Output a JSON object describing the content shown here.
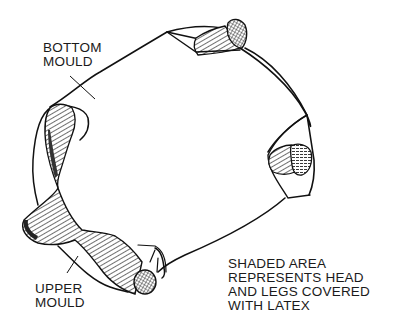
{
  "diagram": {
    "type": "technical-illustration",
    "labels": {
      "bottom_mould": [
        "BOTTOM",
        "MOULD"
      ],
      "upper_mould": [
        "UPPER",
        "MOULD"
      ],
      "caption": [
        "SHADED AREA",
        "REPRESENTS HEAD",
        "AND LEGS COVERED",
        "WITH LATEX"
      ]
    },
    "parts": [
      {
        "id": "bottom-mould",
        "role": "mould outline (lower half)"
      },
      {
        "id": "upper-mould",
        "role": "mould outline (upper half)"
      },
      {
        "id": "latex-head",
        "role": "shaded latex-covered head"
      },
      {
        "id": "latex-leg-top",
        "role": "shaded latex-covered leg"
      },
      {
        "id": "latex-leg-right",
        "role": "shaded latex-covered leg"
      },
      {
        "id": "latex-leg-bottom",
        "role": "shaded latex-covered leg"
      }
    ],
    "colors": {
      "ink": "#111111",
      "background": "#ffffff"
    }
  }
}
